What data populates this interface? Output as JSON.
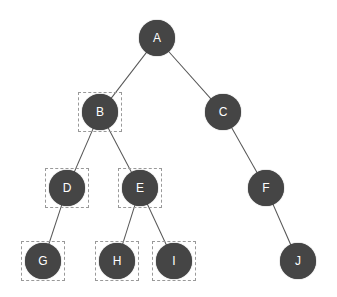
{
  "diagram": {
    "type": "binary-tree",
    "colors": {
      "node_fill": "#454545",
      "node_text": "#ffffff",
      "edge": "#555555",
      "highlight_box": "#999999",
      "background": "#ffffff"
    },
    "nodes": [
      {
        "id": "A",
        "label": "A",
        "x": 157,
        "y": 38,
        "highlighted": false
      },
      {
        "id": "B",
        "label": "B",
        "x": 100,
        "y": 112,
        "highlighted": true
      },
      {
        "id": "C",
        "label": "C",
        "x": 223,
        "y": 112,
        "highlighted": false
      },
      {
        "id": "D",
        "label": "D",
        "x": 67,
        "y": 188,
        "highlighted": true
      },
      {
        "id": "E",
        "label": "E",
        "x": 140,
        "y": 188,
        "highlighted": true
      },
      {
        "id": "F",
        "label": "F",
        "x": 266,
        "y": 188,
        "highlighted": false
      },
      {
        "id": "G",
        "label": "G",
        "x": 43,
        "y": 261,
        "highlighted": true
      },
      {
        "id": "H",
        "label": "H",
        "x": 117,
        "y": 261,
        "highlighted": true
      },
      {
        "id": "I",
        "label": "I",
        "x": 174,
        "y": 261,
        "highlighted": true
      },
      {
        "id": "J",
        "label": "J",
        "x": 298,
        "y": 261,
        "highlighted": false
      }
    ],
    "edges": [
      [
        "A",
        "B"
      ],
      [
        "A",
        "C"
      ],
      [
        "B",
        "D"
      ],
      [
        "B",
        "E"
      ],
      [
        "C",
        "F"
      ],
      [
        "D",
        "G"
      ],
      [
        "E",
        "H"
      ],
      [
        "E",
        "I"
      ],
      [
        "F",
        "J"
      ]
    ]
  }
}
